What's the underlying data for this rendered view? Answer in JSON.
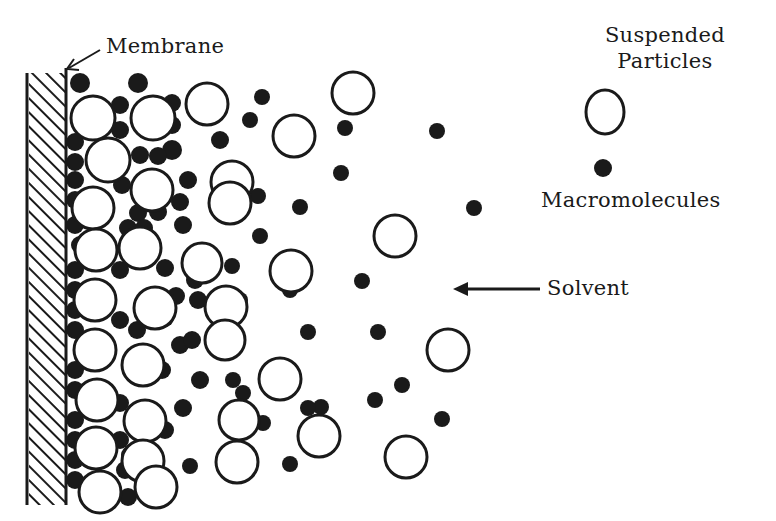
{
  "diagram": {
    "kind": "concentration-polarization schematic",
    "ink_color": "#1a1a1a",
    "background": "#ffffff",
    "labels": {
      "membrane": "Membrane",
      "suspended_particles_line1": "Suspended",
      "suspended_particles_line2": "Particles",
      "macromolecules": "Macromolecules",
      "solvent": "Solvent"
    },
    "legend": [
      {
        "symbol": "open-circle",
        "meaning": "Suspended Particles"
      },
      {
        "symbol": "filled-dot",
        "meaning": "Macromolecules"
      }
    ],
    "membrane": {
      "x_left": 27,
      "x_right": 66,
      "y_top": 73,
      "y_bottom": 505,
      "hatch": "diagonal"
    },
    "solvent_arrow": {
      "x1": 540,
      "y1": 289,
      "x2": 455,
      "y2": 289,
      "direction": "toward-membrane"
    },
    "membrane_pointer": {
      "x1": 100,
      "y1": 50,
      "x2": 66,
      "y2": 70
    },
    "suspended_particles": [
      [
        93,
        118,
        22
      ],
      [
        153,
        118,
        22
      ],
      [
        207,
        104,
        21
      ],
      [
        108,
        160,
        22
      ],
      [
        152,
        190,
        21
      ],
      [
        232,
        182,
        21
      ],
      [
        353,
        93,
        21
      ],
      [
        294,
        136,
        21
      ],
      [
        93,
        208,
        21
      ],
      [
        230,
        203,
        21
      ],
      [
        282,
        130,
        0
      ],
      [
        96,
        250,
        21
      ],
      [
        140,
        248,
        21
      ],
      [
        202,
        263,
        20
      ],
      [
        291,
        271,
        21
      ],
      [
        395,
        236,
        21
      ],
      [
        95,
        300,
        21
      ],
      [
        155,
        308,
        21
      ],
      [
        226,
        307,
        21
      ],
      [
        302,
        270,
        0
      ],
      [
        95,
        350,
        21
      ],
      [
        143,
        365,
        21
      ],
      [
        225,
        340,
        20
      ],
      [
        280,
        379,
        21
      ],
      [
        448,
        350,
        21
      ],
      [
        97,
        400,
        21
      ],
      [
        155,
        386,
        0
      ],
      [
        145,
        421,
        21
      ],
      [
        239,
        420,
        20
      ],
      [
        319,
        436,
        21
      ],
      [
        406,
        457,
        21
      ],
      [
        96,
        448,
        21
      ],
      [
        143,
        461,
        21
      ],
      [
        202,
        432,
        0
      ],
      [
        237,
        462,
        21
      ],
      [
        335,
        457,
        0
      ],
      [
        100,
        492,
        21
      ],
      [
        156,
        487,
        21
      ],
      [
        237,
        462,
        0
      ],
      [
        320,
        436,
        0
      ]
    ],
    "macromolecules": [
      [
        80,
        83,
        10
      ],
      [
        138,
        83,
        10
      ],
      [
        120,
        105,
        9
      ],
      [
        172,
        103,
        9
      ],
      [
        172,
        125,
        9
      ],
      [
        120,
        130,
        9
      ],
      [
        172,
        150,
        10
      ],
      [
        140,
        155,
        9
      ],
      [
        158,
        156,
        9
      ],
      [
        250,
        120,
        8
      ],
      [
        262,
        97,
        8
      ],
      [
        220,
        140,
        9
      ],
      [
        75,
        142,
        9
      ],
      [
        75,
        162,
        9
      ],
      [
        75,
        180,
        9
      ],
      [
        75,
        200,
        9
      ],
      [
        122,
        185,
        9
      ],
      [
        138,
        213,
        9
      ],
      [
        158,
        212,
        9
      ],
      [
        180,
        202,
        9
      ],
      [
        188,
        180,
        9
      ],
      [
        183,
        225,
        9
      ],
      [
        128,
        228,
        9
      ],
      [
        144,
        228,
        9
      ],
      [
        258,
        196,
        8
      ],
      [
        300,
        207,
        8
      ],
      [
        345,
        128,
        8
      ],
      [
        341,
        173,
        8
      ],
      [
        437,
        131,
        8
      ],
      [
        474,
        208,
        8
      ],
      [
        75,
        225,
        9
      ],
      [
        80,
        245,
        9
      ],
      [
        75,
        270,
        9
      ],
      [
        75,
        290,
        9
      ],
      [
        120,
        270,
        9
      ],
      [
        165,
        268,
        9
      ],
      [
        195,
        280,
        9
      ],
      [
        176,
        296,
        9
      ],
      [
        198,
        300,
        9
      ],
      [
        260,
        236,
        8
      ],
      [
        232,
        266,
        8
      ],
      [
        240,
        300,
        8
      ],
      [
        290,
        290,
        8
      ],
      [
        308,
        332,
        8
      ],
      [
        362,
        281,
        8
      ],
      [
        378,
        332,
        8
      ],
      [
        75,
        310,
        9
      ],
      [
        75,
        330,
        9
      ],
      [
        120,
        320,
        9
      ],
      [
        137,
        330,
        9
      ],
      [
        165,
        318,
        9
      ],
      [
        180,
        345,
        9
      ],
      [
        192,
        340,
        9
      ],
      [
        162,
        370,
        9
      ],
      [
        200,
        380,
        9
      ],
      [
        243,
        393,
        8
      ],
      [
        263,
        423,
        8
      ],
      [
        321,
        407,
        8
      ],
      [
        375,
        400,
        8
      ],
      [
        402,
        385,
        8
      ],
      [
        442,
        419,
        8
      ],
      [
        75,
        370,
        9
      ],
      [
        75,
        390,
        9
      ],
      [
        120,
        403,
        9
      ],
      [
        120,
        440,
        9
      ],
      [
        165,
        430,
        9
      ],
      [
        183,
        408,
        9
      ],
      [
        233,
        380,
        8
      ],
      [
        75,
        420,
        9
      ],
      [
        75,
        460,
        9
      ],
      [
        128,
        497,
        9
      ],
      [
        125,
        470,
        9
      ],
      [
        130,
        455,
        9
      ],
      [
        190,
        466,
        8
      ],
      [
        290,
        464,
        8
      ],
      [
        308,
        408,
        8
      ],
      [
        75,
        440,
        9
      ],
      [
        75,
        480,
        9
      ]
    ],
    "legend_symbols": {
      "open_circle": [
        605,
        112,
        20
      ],
      "filled_dot": [
        603,
        168,
        9
      ]
    }
  }
}
